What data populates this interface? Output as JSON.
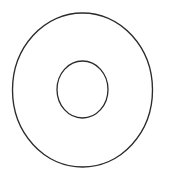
{
  "figure": {
    "name": "concentric-rings-diagram",
    "canvas": {
      "width": 171,
      "height": 180,
      "background_color": "#ffffff"
    },
    "style": {
      "stroke_color": "#2b2b2b",
      "stroke_width": 1.3,
      "fill": "none"
    },
    "shapes": [
      {
        "id": "outer-circle",
        "label": "Outer circle",
        "type": "ellipse",
        "center_x": 82.5,
        "center_y": 90.0,
        "radius_x": 70.0,
        "radius_y": 77.0,
        "stroke_color": "#2b2b2b",
        "stroke_width": 1.35,
        "fill": "none"
      },
      {
        "id": "inner-circle",
        "label": "Inner circle",
        "type": "ellipse",
        "center_x": 82.5,
        "center_y": 89.5,
        "radius_x": 25.5,
        "radius_y": 28.5,
        "stroke_color": "#2b2b2b",
        "stroke_width": 1.3,
        "fill": "none"
      }
    ],
    "annotations": []
  }
}
